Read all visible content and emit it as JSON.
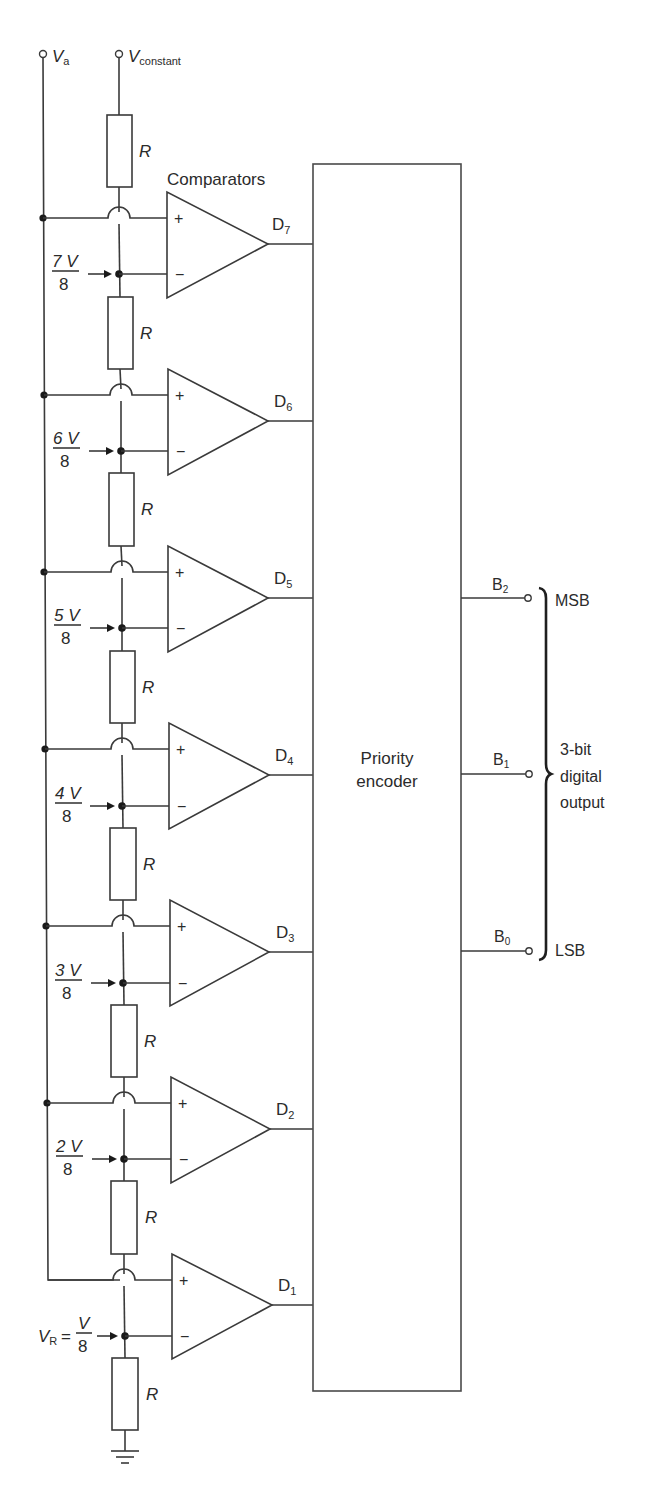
{
  "inputs": {
    "va": {
      "symbol": "V",
      "subscript": "a"
    },
    "vconstant": {
      "symbol": "V",
      "subscript": "constant"
    }
  },
  "comparators_label": "Comparators",
  "resistor_label": "R",
  "encoder": {
    "line1": "Priority",
    "line2": "encoder"
  },
  "stages": [
    {
      "output": "D",
      "output_sub": "7",
      "ref_num": "7 V",
      "ref_den": "8",
      "plus": "+",
      "minus": "−"
    },
    {
      "output": "D",
      "output_sub": "6",
      "ref_num": "6 V",
      "ref_den": "8",
      "plus": "+",
      "minus": "−"
    },
    {
      "output": "D",
      "output_sub": "5",
      "ref_num": "5 V",
      "ref_den": "8",
      "plus": "+",
      "minus": "−"
    },
    {
      "output": "D",
      "output_sub": "4",
      "ref_num": "4 V",
      "ref_den": "8",
      "plus": "+",
      "minus": "−"
    },
    {
      "output": "D",
      "output_sub": "3",
      "ref_num": "3 V",
      "ref_den": "8",
      "plus": "+",
      "minus": "−"
    },
    {
      "output": "D",
      "output_sub": "2",
      "ref_num": "2 V",
      "ref_den": "8",
      "plus": "+",
      "minus": "−"
    },
    {
      "output": "D",
      "output_sub": "1",
      "ref_num": "V",
      "ref_den": "8",
      "ref_prefix": "V",
      "ref_prefix_sub": "R",
      "ref_eq": "=",
      "plus": "+",
      "minus": "−"
    }
  ],
  "outputs": [
    {
      "label": "B",
      "sub": "2",
      "tag": "MSB"
    },
    {
      "label": "B",
      "sub": "1",
      "tag": ""
    },
    {
      "label": "B",
      "sub": "0",
      "tag": "LSB"
    }
  ],
  "output_group": {
    "line1": "3-bit",
    "line2": "digital",
    "line3": "output"
  }
}
